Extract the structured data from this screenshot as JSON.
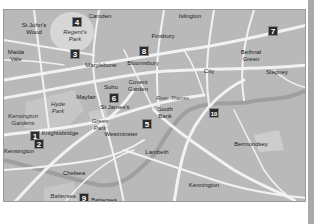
{
  "map": {
    "background_color": "#b9b9b9",
    "road_color": "#f2f2f2",
    "park_color": "#d6d6d6",
    "labels": [
      {
        "text": "St John's\nWood",
        "x": 30,
        "y": 18
      },
      {
        "text": "Camden",
        "x": 96,
        "y": 6
      },
      {
        "text": "Islington",
        "x": 186,
        "y": 6
      },
      {
        "text": "Maida\nVale",
        "x": 12,
        "y": 45
      },
      {
        "text": "Marylebone",
        "x": 97,
        "y": 55
      },
      {
        "text": "Bloomsbury",
        "x": 139,
        "y": 53
      },
      {
        "text": "Finsbury",
        "x": 159,
        "y": 26
      },
      {
        "text": "Bethnal\nGreen",
        "x": 247,
        "y": 45
      },
      {
        "text": "City",
        "x": 205,
        "y": 61
      },
      {
        "text": "Stepney",
        "x": 273,
        "y": 62
      },
      {
        "text": "Soho",
        "x": 107,
        "y": 77
      },
      {
        "text": "Covent\nGarden",
        "x": 134,
        "y": 75
      },
      {
        "text": "Mayfair",
        "x": 82,
        "y": 87
      },
      {
        "text": "South\nBank",
        "x": 161,
        "y": 102
      },
      {
        "text": "St James's",
        "x": 111,
        "y": 97
      },
      {
        "text": "Knightsbridge",
        "x": 56,
        "y": 123
      },
      {
        "text": "Westminster",
        "x": 117,
        "y": 124
      },
      {
        "text": "Lambeth",
        "x": 153,
        "y": 142
      },
      {
        "text": "Bermondsey",
        "x": 247,
        "y": 134
      },
      {
        "text": "Kensington",
        "x": 15,
        "y": 141
      },
      {
        "text": "Chelsea",
        "x": 70,
        "y": 163
      },
      {
        "text": "Kennington",
        "x": 200,
        "y": 175
      },
      {
        "text": "Battersea",
        "x": 100,
        "y": 190
      }
    ],
    "park_labels": [
      {
        "text": "Regent's\nPark",
        "x": 71,
        "y": 25
      },
      {
        "text": "Hyde\nPark",
        "x": 54,
        "y": 97
      },
      {
        "text": "Kensington\nGardens",
        "x": 19,
        "y": 109
      },
      {
        "text": "Green\nPark",
        "x": 96,
        "y": 114
      },
      {
        "text": "Battersea\nPark",
        "x": 59,
        "y": 189
      }
    ],
    "river_labels": [
      {
        "text": "River",
        "x": 158,
        "y": 88
      },
      {
        "text": "Thames",
        "x": 176,
        "y": 88
      }
    ],
    "markers": [
      {
        "num": "1",
        "x": 31,
        "y": 126
      },
      {
        "num": "2",
        "x": 35,
        "y": 134
      },
      {
        "num": "3",
        "x": 71,
        "y": 44
      },
      {
        "num": "4",
        "x": 73,
        "y": 12
      },
      {
        "num": "5",
        "x": 143,
        "y": 114
      },
      {
        "num": "6",
        "x": 110,
        "y": 88
      },
      {
        "num": "7",
        "x": 269,
        "y": 21
      },
      {
        "num": "8",
        "x": 140,
        "y": 41
      },
      {
        "num": "9",
        "x": 80,
        "y": 188
      },
      {
        "num": "10",
        "x": 210,
        "y": 103
      }
    ],
    "scale": {
      "labels": [
        "2",
        "1",
        "miles",
        "0",
        "km",
        "1",
        "2"
      ]
    }
  }
}
